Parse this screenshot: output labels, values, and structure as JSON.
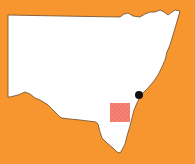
{
  "map": {
    "region": "New South Wales",
    "background_color": "#F7962F",
    "land_color": "#FFFFFF",
    "outline_color": "#6B4A2A",
    "outline_points": "8,15 60,16 120,17 124,14 128,13 133,16 140,17 145,14 150,12 155,12 160,10 164,12 168,15 172,12 175,10 180,11 178,18 176,25 173,35 170,45 167,52 165,60 162,67 158,75 154,81 148,88 143,93 140,97 137,103 134,110 132,118 130,126 127,136 125,144 122,150 120,153 117,152 113,148 107,143 102,138 100,132 98,124 96,122 88,121 80,120 70,119 62,118 60,117 54,111 48,105 45,103 40,100 35,98 30,94 25,92 18,95 10,97 8,97",
    "marker": {
      "label": "Sydney",
      "cx": 139,
      "cy": 95,
      "r": 4,
      "color": "#111111"
    },
    "highlight_area": {
      "x": 110,
      "y": 103,
      "width": 20,
      "height": 19,
      "color": "#F2766A",
      "hatch_color": "#F7A090"
    }
  }
}
